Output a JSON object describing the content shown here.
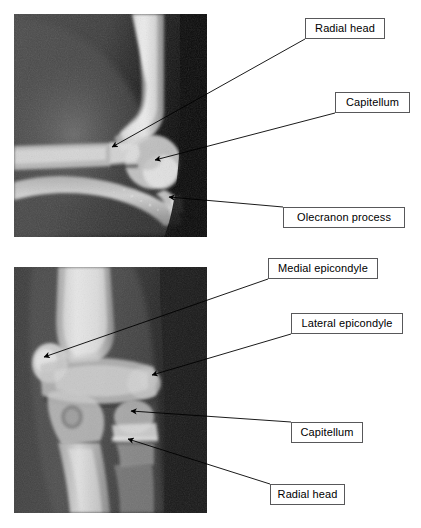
{
  "figure": {
    "width": 421,
    "height": 528,
    "background": "#ffffff",
    "label_border_color": "#58585a",
    "label_text_color": "#000000",
    "leader_line_color": "#000000"
  },
  "panels": [
    {
      "id": "lateral-elbow-radiograph",
      "name": "Lateral elbow radiograph",
      "view": "lateral",
      "x": 14,
      "y": 14,
      "width": 193,
      "height": 223
    },
    {
      "id": "ap-elbow-radiograph",
      "name": "AP elbow radiograph",
      "view": "anteroposterior",
      "x": 14,
      "y": 267,
      "width": 193,
      "height": 246
    }
  ],
  "annotations": [
    {
      "id": "radial-head-lateral",
      "label": "Radial head",
      "panel": "lateral-elbow-radiograph",
      "box": {
        "x": 305,
        "y": 18,
        "width": 80,
        "height": 21
      },
      "leader_from": {
        "x": 305,
        "y": 39
      },
      "arrow_tip": {
        "x": 112,
        "y": 147
      }
    },
    {
      "id": "capitellum-lateral",
      "label": "Capitellum",
      "panel": "lateral-elbow-radiograph",
      "box": {
        "x": 335,
        "y": 92,
        "width": 75,
        "height": 21
      },
      "leader_from": {
        "x": 335,
        "y": 113
      },
      "arrow_tip": {
        "x": 155,
        "y": 160
      }
    },
    {
      "id": "olecranon-process-lateral",
      "label": "Olecranon process",
      "panel": "lateral-elbow-radiograph",
      "box": {
        "x": 283,
        "y": 207,
        "width": 122,
        "height": 21
      },
      "leader_from": {
        "x": 283,
        "y": 207
      },
      "arrow_tip": {
        "x": 169,
        "y": 197
      }
    },
    {
      "id": "medial-epicondyle-ap",
      "label": "Medial epicondyle",
      "panel": "ap-elbow-radiograph",
      "box": {
        "x": 268,
        "y": 258,
        "width": 110,
        "height": 21
      },
      "leader_from": {
        "x": 268,
        "y": 279
      },
      "arrow_tip": {
        "x": 44,
        "y": 357
      }
    },
    {
      "id": "lateral-epicondyle-ap",
      "label": "Lateral epicondyle",
      "panel": "ap-elbow-radiograph",
      "box": {
        "x": 291,
        "y": 313,
        "width": 112,
        "height": 21
      },
      "leader_from": {
        "x": 291,
        "y": 334
      },
      "arrow_tip": {
        "x": 152,
        "y": 375
      }
    },
    {
      "id": "capitellum-ap",
      "label": "Capitellum",
      "panel": "ap-elbow-radiograph",
      "box": {
        "x": 291,
        "y": 422,
        "width": 72,
        "height": 21
      },
      "leader_from": {
        "x": 291,
        "y": 422
      },
      "arrow_tip": {
        "x": 131,
        "y": 411
      }
    },
    {
      "id": "radial-head-ap",
      "label": "Radial head",
      "panel": "ap-elbow-radiograph",
      "box": {
        "x": 270,
        "y": 484,
        "width": 75,
        "height": 21
      },
      "leader_from": {
        "x": 270,
        "y": 484
      },
      "arrow_tip": {
        "x": 128,
        "y": 439
      }
    }
  ]
}
